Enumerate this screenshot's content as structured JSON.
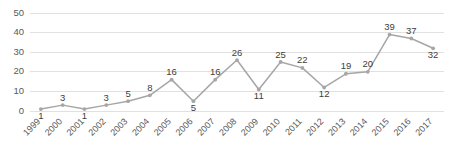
{
  "chart_data": {
    "type": "line",
    "title": "",
    "subtitle": "",
    "xlabel": "",
    "ylabel": "",
    "categories": [
      "1999",
      "2000",
      "2001",
      "2002",
      "2003",
      "2004",
      "2005",
      "2006",
      "2007",
      "2008",
      "2009",
      "2010",
      "2011",
      "2012",
      "2013",
      "2014",
      "2015",
      "2016",
      "2017"
    ],
    "values": [
      1,
      3,
      1,
      3,
      5,
      8,
      16,
      5,
      16,
      26,
      11,
      25,
      22,
      12,
      19,
      20,
      39,
      37,
      32
    ],
    "series": [
      {
        "name": "",
        "values": [
          1,
          3,
          1,
          3,
          5,
          8,
          16,
          5,
          16,
          26,
          11,
          25,
          22,
          12,
          19,
          20,
          39,
          37,
          32
        ]
      }
    ],
    "data_labels": [
      "1",
      "3",
      "1",
      "3",
      "5",
      "8",
      "16",
      "5",
      "16",
      "26",
      "11",
      "25",
      "22",
      "12",
      "19",
      "20",
      "39",
      "37",
      "32"
    ],
    "ylim": [
      0,
      50
    ],
    "yticks": [
      0,
      10,
      20,
      30,
      40,
      50
    ],
    "ytick_labels": [
      "0",
      "10",
      "20",
      "30",
      "40",
      "50"
    ],
    "grid": true,
    "grid_axis": "y",
    "legend": false,
    "legend_position": "none",
    "markers": true,
    "xtick_rotation": -45,
    "colors": {
      "line": "#a6a6a6",
      "marker": "#a6a6a6",
      "gridline": "#d9d9d9",
      "tick_text": "#595959",
      "label_text": "#404040",
      "background": "#ffffff"
    }
  }
}
